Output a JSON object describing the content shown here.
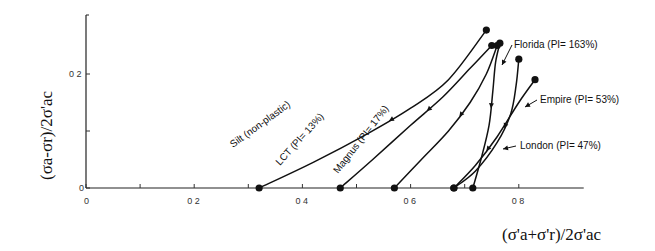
{
  "chart_data": {
    "type": "line",
    "title": "",
    "xlabel": "(σ'a+σ'r)/2σ'ac",
    "ylabel": "(σa-σr)/2σ'ac",
    "xlim": [
      0,
      1.0
    ],
    "ylim": [
      0,
      0.3
    ],
    "x_ticks": [
      0,
      0.1,
      0.2,
      0.3,
      0.4,
      0.5,
      0.6,
      0.7,
      0.8
    ],
    "x_tick_labels": [
      {
        "value": 0,
        "label": "0"
      },
      {
        "value": 0.2,
        "label": "0 2"
      },
      {
        "value": 0.4,
        "label": "0 4"
      },
      {
        "value": 0.6,
        "label": "0 6"
      },
      {
        "value": 0.8,
        "label": "0 8"
      }
    ],
    "y_ticks": [
      0,
      0.1,
      0.2
    ],
    "y_tick_labels": [
      {
        "value": 0,
        "label": "0"
      },
      {
        "value": 0.2,
        "label": "0 2"
      }
    ],
    "grid": false,
    "legend": "none",
    "series": [
      {
        "name": "Silt (non-plastic)",
        "label_pos": "along-curve",
        "points": [
          [
            0.32,
            0
          ],
          [
            0.42,
            0.045
          ],
          [
            0.52,
            0.095
          ],
          [
            0.6,
            0.14
          ],
          [
            0.67,
            0.19
          ],
          [
            0.74,
            0.277
          ]
        ]
      },
      {
        "name": "LCT (PI= 13%)",
        "label_pos": "along-curve",
        "points": [
          [
            0.47,
            0
          ],
          [
            0.53,
            0.05
          ],
          [
            0.6,
            0.11
          ],
          [
            0.66,
            0.16
          ],
          [
            0.71,
            0.21
          ],
          [
            0.75,
            0.25
          ]
        ]
      },
      {
        "name": "Magnus (PI= 17%)",
        "label_pos": "along-curve",
        "points": [
          [
            0.57,
            0
          ],
          [
            0.62,
            0.05
          ],
          [
            0.67,
            0.1
          ],
          [
            0.71,
            0.15
          ],
          [
            0.74,
            0.2
          ],
          [
            0.76,
            0.25
          ]
        ]
      },
      {
        "name": "Florida (PI= 163%)",
        "label_pos": "top-right",
        "points": [
          [
            0.715,
            0
          ],
          [
            0.73,
            0.05
          ],
          [
            0.745,
            0.11
          ],
          [
            0.752,
            0.17
          ],
          [
            0.757,
            0.22
          ],
          [
            0.765,
            0.254
          ]
        ]
      },
      {
        "name": "Empire (PI= 53%)",
        "label_pos": "right",
        "points": [
          [
            0.68,
            0
          ],
          [
            0.72,
            0.04
          ],
          [
            0.76,
            0.09
          ],
          [
            0.8,
            0.15
          ],
          [
            0.83,
            0.19
          ]
        ]
      },
      {
        "name": "London (PI= 47%)",
        "label_pos": "lower-right",
        "points": [
          [
            0.68,
            0
          ],
          [
            0.72,
            0.03
          ],
          [
            0.76,
            0.08
          ],
          [
            0.785,
            0.13
          ],
          [
            0.795,
            0.18
          ],
          [
            0.8,
            0.226
          ]
        ]
      }
    ]
  }
}
